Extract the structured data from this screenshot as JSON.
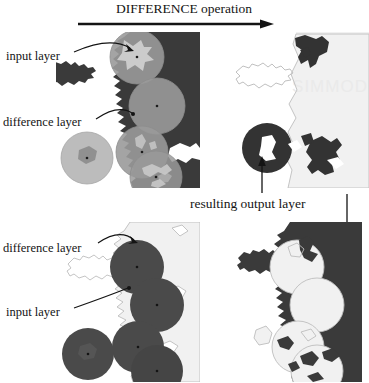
{
  "figure": {
    "title": "DIFFERENCE operation",
    "type": "gis-overlay-diagram",
    "background_color": "#ffffff"
  },
  "palette": {
    "land_dark": "#3a3a3a",
    "land_dark_alt": "#333333",
    "water_white": "#ffffff",
    "panel_light": "#f1f1f1",
    "circle_gray": "#9a9a9a",
    "circle_gray_overlap": "#8a8a8a",
    "circle_light_gray": "#b8b8b8",
    "outline_gray": "#b5b5b5",
    "ink": "#141414",
    "watermark": "#f0f0f0"
  },
  "header": {
    "label": "DIFFERENCE operation",
    "arrow_name": "operation-arrow"
  },
  "rows": [
    {
      "id": "row-top",
      "name": "difference-operation-example-top",
      "input_panel": {
        "name": "input-panel-top",
        "description": "dark landmass with translucent gray circles overlaid",
        "labels": [
          {
            "id": "input-layer-top",
            "text": "input layer",
            "target": "dark landmass"
          },
          {
            "id": "difference-layer-top",
            "text": "difference layer",
            "target": "gray circles"
          }
        ]
      },
      "output_panel": {
        "name": "output-panel-top",
        "description": "resulting layer: landmass minus circles"
      }
    },
    {
      "id": "row-bottom",
      "name": "difference-operation-example-bottom",
      "input_panel": {
        "name": "input-panel-bottom",
        "description": "light landmass with solid dark circles overlaid",
        "labels": [
          {
            "id": "difference-layer-bottom",
            "text": "difference layer",
            "target": "dark circles"
          },
          {
            "id": "input-layer-bottom",
            "text": "input layer",
            "target": "light landmass"
          }
        ]
      },
      "output_panel": {
        "name": "output-panel-bottom",
        "description": "resulting layer: landmass minus circles"
      }
    }
  ],
  "labels": {
    "input_layer_top": "input layer",
    "difference_layer_top": "difference layer",
    "difference_layer_bottom": "difference layer",
    "input_layer_bottom": "input layer",
    "resulting_output_layer": "resulting output layer"
  },
  "annotations": {
    "resulting_output_layer": {
      "text": "resulting output layer",
      "arrows": [
        {
          "id": "arrow-up-left",
          "direction": "up",
          "points_to": "output-panel-top-circle"
        },
        {
          "id": "arrow-down-right",
          "direction": "down",
          "points_to": "output-panel-bottom-edge"
        }
      ]
    }
  },
  "watermark": {
    "text": "SIMMOD",
    "visible": "faint"
  }
}
